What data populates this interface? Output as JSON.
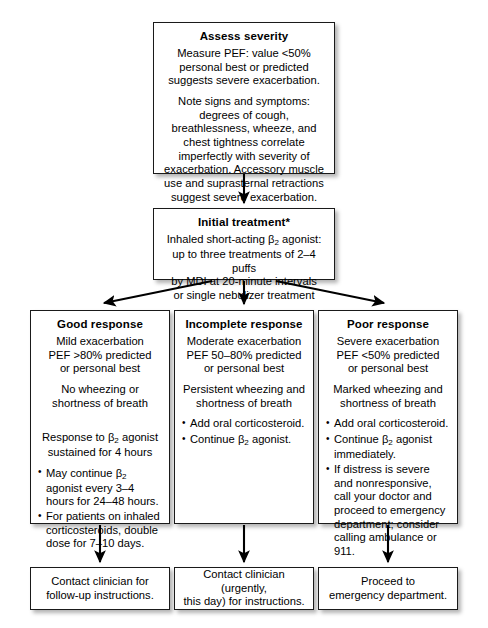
{
  "diagram": {
    "type": "flowchart",
    "orientation": "top-down"
  },
  "nodes": {
    "assess": {
      "title": "Assess severity",
      "para1": "Measure PEF: value <50% personal best or predicted suggests severe exacerbation.",
      "para2": "Note signs and symptoms: degrees of cough, breathlessness, wheeze, and chest tightness correlate imperfectly with severity of exacerbation. Accessory muscle use and suprasternal retractions suggest severe exacerbation."
    },
    "initial": {
      "title": "Initial treatment*",
      "line1_pre": "Inhaled short-acting β",
      "line1_sub": "2",
      "line1_post": " agonist:",
      "line2": "up to three treatments of 2–4 puffs",
      "line3": "by MDI at 20-minute intervals",
      "line4": "or single nebulizer treatment"
    },
    "good": {
      "title": "Good response",
      "para1": "Mild exacerbation\nPEF >80% predicted\nor personal best",
      "para2": "No wheezing or\nshortness of breath",
      "para3_pre": "Response to β",
      "para3_sub": "2",
      "para3_post": " agonist\nsustained for 4 hours",
      "bullets": [
        {
          "pre": "May continue β",
          "sub": "2",
          "post": " agonist every 3–4 hours for 24–48 hours."
        },
        {
          "pre": "For patients on inhaled corticosteroids, double dose for 7–10 days.",
          "sub": "",
          "post": ""
        }
      ]
    },
    "incomplete": {
      "title": "Incomplete response",
      "para1": "Moderate exacerbation\nPEF 50–80% predicted\nor personal best",
      "para2": "Persistent wheezing and\nshortness of breath",
      "bullets": [
        {
          "pre": "Add oral corticosteroid.",
          "sub": "",
          "post": ""
        },
        {
          "pre": "Continue β",
          "sub": "2",
          "post": " agonist."
        }
      ]
    },
    "poor": {
      "title": "Poor response",
      "para1": "Severe exacerbation\nPEF <50% predicted\nor personal best",
      "para2": "Marked wheezing and\nshortness of breath",
      "bullets": [
        {
          "pre": "Add oral corticosteroid.",
          "sub": "",
          "post": ""
        },
        {
          "pre": "Continue β",
          "sub": "2",
          "post": " agonist immediately."
        },
        {
          "pre": "If distress is severe and nonresponsive, call your doctor and proceed to emergency department; consider calling ambulance or 911.",
          "sub": "",
          "post": ""
        }
      ]
    },
    "out_good": {
      "text": "Contact clinician for\nfollow-up instructions."
    },
    "out_incomplete": {
      "text": "Contact clinician (urgently,\nthis day) for instructions."
    },
    "out_poor": {
      "text": "Proceed to\nemergency department."
    }
  },
  "edges": [
    {
      "from": "assess",
      "to": "initial",
      "style": "straight-arrow"
    },
    {
      "from": "initial",
      "to": "good",
      "style": "diagonal-arrow"
    },
    {
      "from": "initial",
      "to": "incomplete",
      "style": "straight-arrow"
    },
    {
      "from": "initial",
      "to": "poor",
      "style": "diagonal-arrow"
    },
    {
      "from": "good",
      "to": "out_good",
      "style": "straight-arrow"
    },
    {
      "from": "incomplete",
      "to": "out_incomplete",
      "style": "straight-arrow"
    },
    {
      "from": "poor",
      "to": "out_poor",
      "style": "straight-arrow"
    }
  ],
  "colors": {
    "background": "#ffffff",
    "box_border": "#1a1a1a",
    "box_fill": "#ffffff",
    "text": "#000000",
    "arrow": "#000000"
  }
}
